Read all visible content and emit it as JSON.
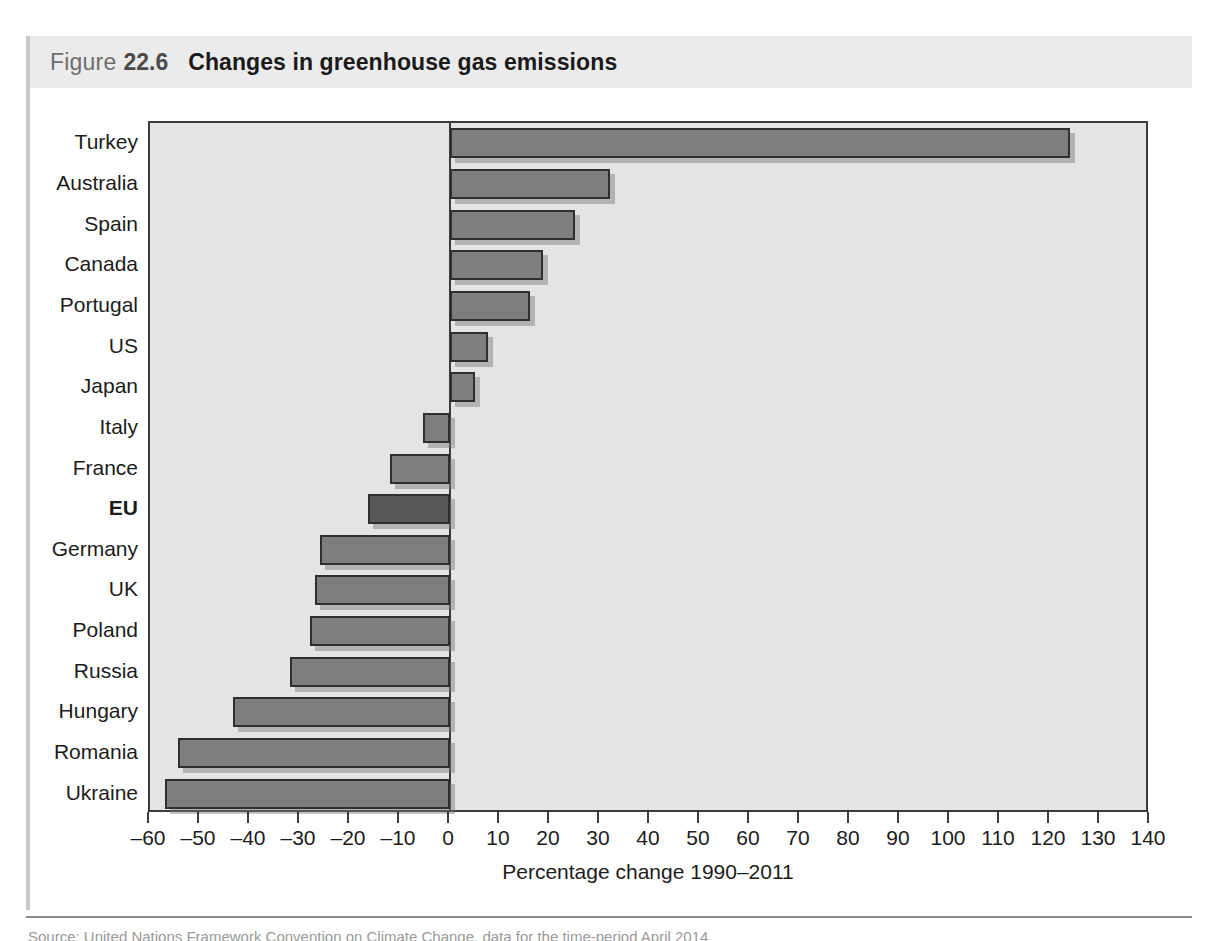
{
  "figure": {
    "label": "Figure",
    "number": "22.6",
    "title": "Changes in greenhouse gas emissions"
  },
  "source": {
    "text": "Source: United Nations Framework Convention on Climate Change, data for the time-period April 2014"
  },
  "chart_data": {
    "type": "bar",
    "orientation": "horizontal",
    "title": "Changes in greenhouse gas emissions",
    "xlabel": "Percentage change 1990–2011",
    "ylabel": "",
    "xlim": [
      -60,
      140
    ],
    "xticks": [
      -60,
      -50,
      -40,
      -30,
      -20,
      -10,
      0,
      10,
      20,
      30,
      40,
      50,
      60,
      70,
      80,
      90,
      100,
      110,
      120,
      130,
      140
    ],
    "xtick_labels": [
      "–60",
      "–50",
      "–40",
      "–30",
      "–20",
      "–10",
      "0",
      "10",
      "20",
      "30",
      "40",
      "50",
      "60",
      "70",
      "80",
      "90",
      "100",
      "110",
      "120",
      "130",
      "140"
    ],
    "grid": false,
    "legend": "none",
    "categories": [
      "Turkey",
      "Australia",
      "Spain",
      "Canada",
      "Portugal",
      "US",
      "Japan",
      "Italy",
      "France",
      "EU",
      "Germany",
      "UK",
      "Poland",
      "Russia",
      "Hungary",
      "Romania",
      "Ukraine"
    ],
    "values": [
      124,
      32,
      25,
      18.5,
      16,
      7.5,
      5,
      -5.5,
      -12,
      -16.5,
      -26,
      -27,
      -28,
      -32,
      -43.5,
      -54.5,
      -57
    ],
    "highlight_category": "EU",
    "bar_color": "#7e7e7e",
    "highlight_color": "#575757",
    "bar_edge_color": "#2f2f2f",
    "plot_background": "#e4e4e4",
    "axis_color": "#3b3b3b",
    "bars": [
      {
        "category": "Turkey",
        "value": 124,
        "bold": false
      },
      {
        "category": "Australia",
        "value": 32,
        "bold": false
      },
      {
        "category": "Spain",
        "value": 25,
        "bold": false
      },
      {
        "category": "Canada",
        "value": 18.5,
        "bold": false
      },
      {
        "category": "Portugal",
        "value": 16,
        "bold": false
      },
      {
        "category": "US",
        "value": 7.5,
        "bold": false
      },
      {
        "category": "Japan",
        "value": 5,
        "bold": false
      },
      {
        "category": "Italy",
        "value": -5.5,
        "bold": false
      },
      {
        "category": "France",
        "value": -12,
        "bold": false
      },
      {
        "category": "EU",
        "value": -16.5,
        "bold": true
      },
      {
        "category": "Germany",
        "value": -26,
        "bold": false
      },
      {
        "category": "UK",
        "value": -27,
        "bold": false
      },
      {
        "category": "Poland",
        "value": -28,
        "bold": false
      },
      {
        "category": "Russia",
        "value": -32,
        "bold": false
      },
      {
        "category": "Hungary",
        "value": -43.5,
        "bold": false
      },
      {
        "category": "Romania",
        "value": -54.5,
        "bold": false
      },
      {
        "category": "Ukraine",
        "value": -57,
        "bold": false
      }
    ]
  }
}
